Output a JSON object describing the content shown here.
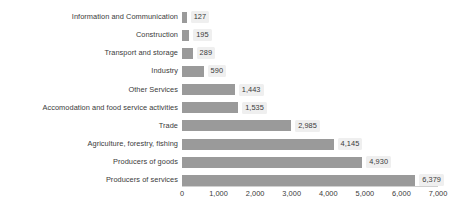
{
  "chart_data": {
    "type": "bar",
    "orientation": "horizontal",
    "title": "",
    "subtitle": "",
    "xlabel": "",
    "ylabel": "",
    "grid": false,
    "legend": null,
    "xlim": [
      0,
      7000
    ],
    "categories": [
      "Information and Communication",
      "Construction",
      "Transport and storage",
      "Industry",
      "Other Services",
      "Accomodation and food service activities",
      "Trade",
      "Agriculture, forestry, fishing",
      "Producers of goods",
      "Producers of services"
    ],
    "values": [
      127,
      195,
      289,
      590,
      1443,
      1535,
      2985,
      4145,
      4930,
      6379
    ],
    "value_labels": [
      "127",
      "195",
      "289",
      "590",
      "1,443",
      "1,535",
      "2,985",
      "4,145",
      "4,930",
      "6,379"
    ],
    "xticks": [
      0,
      1000,
      2000,
      3000,
      4000,
      5000,
      6000,
      7000
    ],
    "xtick_labels": [
      "0",
      "1,000",
      "2,000",
      "3,000",
      "4,000",
      "5,000",
      "6,000",
      "7,000"
    ],
    "colors": {
      "bar": "#9a9a9a",
      "label_background": "#efefef",
      "text": "#3a3a3a",
      "axis": "#d0d0d0",
      "background": "#ffffff"
    }
  }
}
